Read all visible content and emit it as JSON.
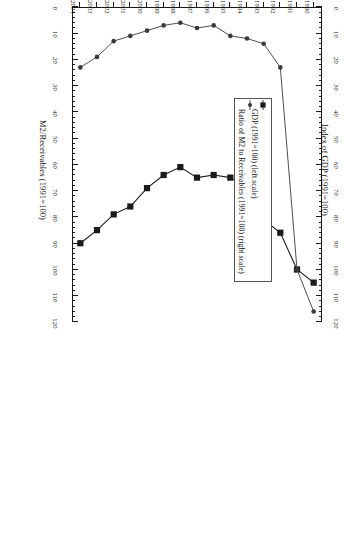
{
  "chart_data": {
    "type": "line",
    "title": "",
    "orientation_note": "printed-upside-down",
    "x": [
      1990,
      1991,
      1992,
      1993,
      1994,
      1995,
      1996,
      1997,
      1998,
      1999,
      2000,
      2001,
      2002,
      2003,
      2004
    ],
    "xlabel": "",
    "xtick_labels": [
      "1990",
      "1991",
      "1992",
      "1993",
      "1994",
      "1995",
      "1996",
      "1997",
      "1998",
      "1999",
      "2000",
      "2001",
      "2002",
      "2003",
      "2004"
    ],
    "left_axis": {
      "label": "Index of GDP (1991=100)",
      "ticks": [
        0,
        10,
        20,
        30,
        40,
        50,
        60,
        70,
        80,
        90,
        100,
        110,
        120
      ],
      "lim": [
        0,
        120
      ]
    },
    "right_axis": {
      "label": "M2/Receivables (1991=100)",
      "ticks": [
        0,
        10,
        20,
        30,
        40,
        50,
        60,
        70,
        80,
        90,
        100,
        110,
        120
      ],
      "lim": [
        0,
        120
      ]
    },
    "series": [
      {
        "name": "GDP (1991=100) (left scale)",
        "axis": "left",
        "marker": "filled-square",
        "color": "#1a1a1a",
        "values": [
          105,
          100,
          86,
          81,
          69,
          65,
          64,
          65,
          61,
          64,
          69,
          76,
          79,
          85,
          90
        ]
      },
      {
        "name": "Ratio of M2 to Receivables (1991=100) (right scale)",
        "axis": "right",
        "marker": "filled-circle",
        "color": "#3a3a3a",
        "values": [
          116,
          100,
          23,
          14,
          12,
          11,
          7,
          8,
          6,
          7,
          9,
          11,
          13,
          19,
          23
        ]
      }
    ],
    "legend": {
      "position": "inside-left",
      "entries": [
        {
          "label": "GDP (1991=100) (left scale)",
          "marker": "filled-square"
        },
        {
          "label": "Ratio of M2 to Receivables (1991=100) (right scale)",
          "marker": "filled-circle"
        }
      ]
    },
    "grid": false
  }
}
